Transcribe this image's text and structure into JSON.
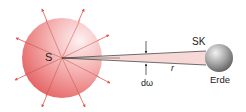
{
  "labels": {
    "sun": "S",
    "spacecraft": "SK",
    "earth": "Erde",
    "distance": "r",
    "solid_angle": "dω"
  },
  "colors": {
    "sun_fill_light": "#fbe0e0",
    "sun_fill_dark": "#e9686a",
    "ray_color": "#e2574f",
    "cone_fill": "#f6d9d7",
    "earth_light": "#e4e4e4",
    "earth_dark": "#6b6b6b"
  }
}
